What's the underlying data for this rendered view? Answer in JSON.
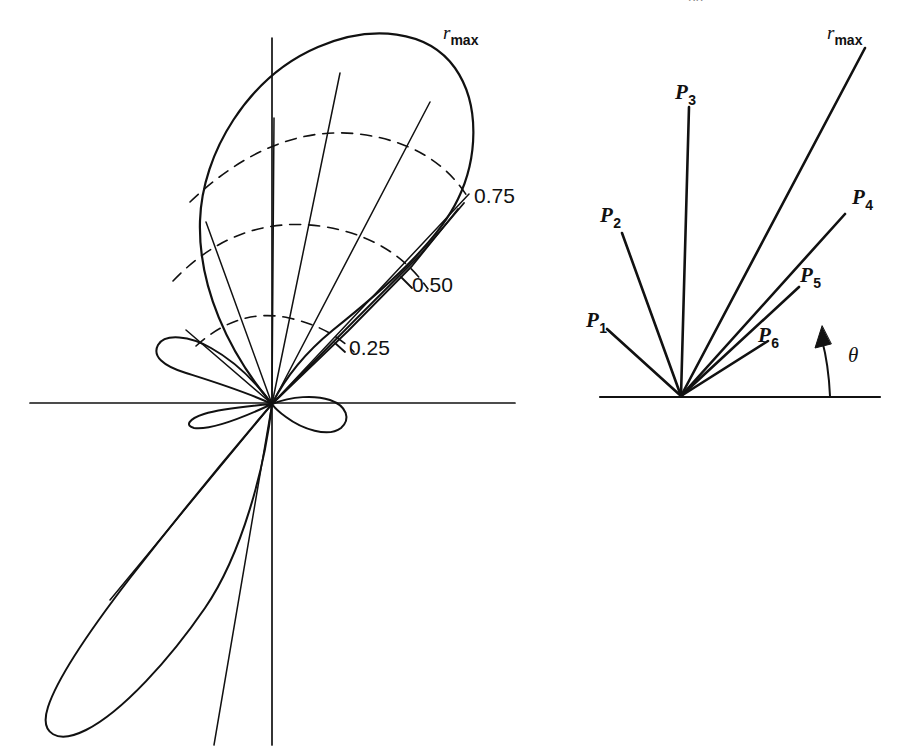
{
  "figure": {
    "domain": "diagram",
    "kind": "antenna-radiation-pattern",
    "background_color": "#ffffff",
    "stroke_color": "#111111",
    "header_remnant": "pp",
    "panels": [
      {
        "id": "left",
        "name": "polar-radiation-pattern",
        "origin": {
          "x": 272,
          "y": 404
        },
        "axes": {
          "horizontal": {
            "x1": 30,
            "y1": 403,
            "x2": 515,
            "y2": 403
          },
          "vertical": {
            "x1": 272,
            "y1": 38,
            "x2": 272,
            "y2": 745
          }
        },
        "radial_labels": [
          {
            "text": "0.25",
            "x": 349,
            "y": 337,
            "value": 0.25
          },
          {
            "text": "0.50",
            "x": 412,
            "y": 274,
            "value": 0.5
          },
          {
            "text": "0.75",
            "x": 474,
            "y": 185,
            "value": 0.75
          },
          {
            "text": "r",
            "sub": "max",
            "x": 443,
            "y": 23,
            "value": 1.0
          }
        ],
        "grid_rings": [
          0.25,
          0.5,
          0.75,
          1.0
        ],
        "grid_ring_style": "dashed",
        "grid_ray_angles_deg": [
          58,
          73,
          88,
          103,
          118
        ]
      },
      {
        "id": "right",
        "name": "ray-definition-diagram",
        "origin": {
          "x": 681,
          "y": 396
        },
        "baseline": {
          "x1": 600,
          "y1": 397,
          "x2": 880,
          "y2": 397
        },
        "rays": [
          {
            "label": "P",
            "sub": "1",
            "angle_deg": 118,
            "length": 200,
            "label_x": 586,
            "label_y": 310
          },
          {
            "label": "P",
            "sub": "2",
            "angle_deg": 107,
            "length": 285,
            "label_x": 600,
            "label_y": 205
          },
          {
            "label": "P",
            "sub": "3",
            "angle_deg": 91,
            "length": 300,
            "label_x": 675,
            "label_y": 82
          },
          {
            "label": "P",
            "sub": "4",
            "angle_deg": 46,
            "length": 260,
            "label_x": 852,
            "label_y": 187
          },
          {
            "label": "P",
            "sub": "5",
            "angle_deg": 43,
            "length": 185,
            "label_x": 800,
            "label_y": 265
          },
          {
            "label": "P",
            "sub": "6",
            "angle_deg": 41,
            "length": 128,
            "label_x": 758,
            "label_y": 325
          }
        ],
        "rmax_ray": {
          "label": "r",
          "sub": "max",
          "angle_deg": 60,
          "length": 355,
          "label_x": 827,
          "label_y": 23
        },
        "theta_marker": {
          "label": "θ",
          "label_x": 848,
          "label_y": 345,
          "arc_base_x": 830,
          "arc_base_y": 396
        }
      }
    ]
  }
}
